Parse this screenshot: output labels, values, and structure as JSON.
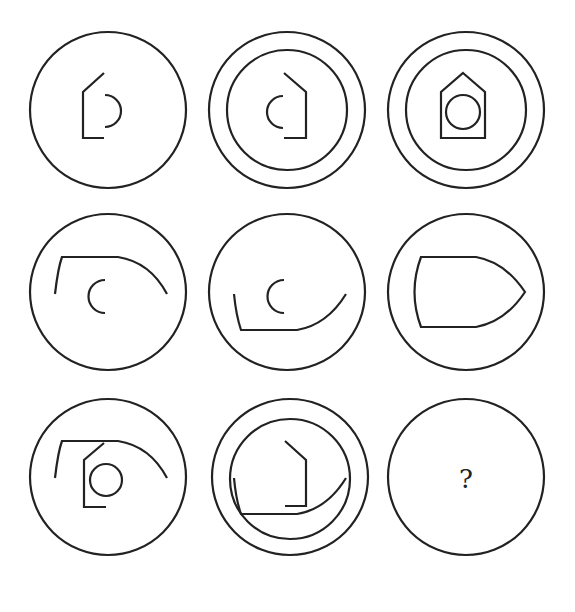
{
  "puzzle": {
    "type": "3x3 figure-reasoning matrix",
    "stroke_color": "#222222",
    "background": "#ffffff",
    "cells": [
      {
        "row": 1,
        "col": 1,
        "rings": 1,
        "content": "left half of house outline with right-facing half-circle"
      },
      {
        "row": 1,
        "col": 2,
        "rings": 2,
        "content": "right half of house outline with left-facing half-circle"
      },
      {
        "row": 1,
        "col": 3,
        "rings": 2,
        "content": "full house outline with full circle"
      },
      {
        "row": 2,
        "col": 1,
        "rings": 1,
        "content": "upper half of boat outline with left-facing half-circle"
      },
      {
        "row": 2,
        "col": 2,
        "rings": 1,
        "content": "lower half of boat outline with left-facing half-circle"
      },
      {
        "row": 2,
        "col": 3,
        "rings": 1,
        "content": "full boat outline"
      },
      {
        "row": 3,
        "col": 1,
        "rings": 1,
        "content": "upper boat half with left house half and full circle"
      },
      {
        "row": 3,
        "col": 2,
        "rings": 2,
        "content": "lower boat half with right house half"
      },
      {
        "row": 3,
        "col": 3,
        "rings": 1,
        "content": "unknown",
        "label": "?"
      }
    ]
  }
}
